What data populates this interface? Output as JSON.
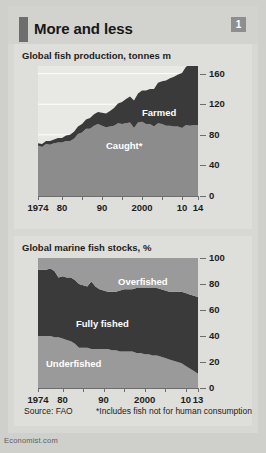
{
  "header": {
    "title": "More and less",
    "badge": "1"
  },
  "footer": {
    "source": "Source: FAO",
    "note": "*Includes fish not for human consumption",
    "brand": "Economist.com"
  },
  "colors": {
    "page_background": "#cfcfcb",
    "panel_background": "#dededa",
    "plot_background": "#e8e8e4",
    "light_gray": "#9a9a9a",
    "mid_gray": "#8c8c8c",
    "dark": "#3a3a3a",
    "text": "#1d1d20",
    "axis": "#6d6d6d"
  },
  "chart_data": [
    {
      "id": "fish-production",
      "type": "area",
      "stacked": true,
      "title": "Global fish production, tonnes m",
      "xlabel": "",
      "ylabel": "",
      "ylim": [
        0,
        170
      ],
      "yticks": [
        0,
        40,
        80,
        120,
        160
      ],
      "grid": true,
      "legend": "inline-labels",
      "xlim": [
        1974,
        2014
      ],
      "xticks": [
        1974,
        1980,
        1985,
        1990,
        1995,
        2000,
        2005,
        2010,
        2014
      ],
      "xticklabels": [
        "1974",
        "80",
        "",
        "90",
        "",
        "2000",
        "",
        "10",
        "14"
      ],
      "x": [
        1974,
        1975,
        1976,
        1977,
        1978,
        1979,
        1980,
        1981,
        1982,
        1983,
        1984,
        1985,
        1986,
        1987,
        1988,
        1989,
        1990,
        1991,
        1992,
        1993,
        1994,
        1995,
        1996,
        1997,
        1998,
        1999,
        2000,
        2001,
        2002,
        2003,
        2004,
        2005,
        2006,
        2007,
        2008,
        2009,
        2010,
        2011,
        2012,
        2013,
        2014
      ],
      "series": [
        {
          "name": "Caught*",
          "color": "#8c8c8c",
          "label_position": "lower-middle",
          "values": [
            66,
            64,
            68,
            67,
            69,
            70,
            70,
            72,
            72,
            75,
            81,
            83,
            88,
            88,
            92,
            94,
            92,
            90,
            91,
            92,
            95,
            94,
            95,
            96,
            89,
            96,
            97,
            94,
            94,
            91,
            95,
            94,
            92,
            92,
            91,
            91,
            89,
            93,
            92,
            93,
            93
          ]
        },
        {
          "name": "Farmed",
          "color": "#3a3a3a",
          "label_position": "upper-right",
          "values": [
            3,
            4,
            4,
            5,
            5,
            6,
            6,
            7,
            8,
            9,
            10,
            11,
            12,
            14,
            15,
            16,
            17,
            18,
            20,
            23,
            26,
            29,
            32,
            34,
            36,
            38,
            41,
            44,
            46,
            49,
            53,
            56,
            59,
            62,
            65,
            68,
            72,
            76,
            80,
            84,
            88
          ]
        }
      ],
      "total_note": "top of stack reaches about 167 in 2014"
    },
    {
      "id": "marine-fish-stocks",
      "type": "area",
      "stacked": true,
      "title": "Global marine fish stocks, %",
      "xlabel": "",
      "ylabel": "",
      "ylim": [
        0,
        100
      ],
      "yticks": [
        0,
        20,
        40,
        60,
        80,
        100
      ],
      "grid": true,
      "legend": "inline-labels",
      "xlim": [
        1974,
        2013
      ],
      "xticks": [
        1974,
        1980,
        1985,
        1990,
        1995,
        2000,
        2005,
        2010,
        2013
      ],
      "xticklabels": [
        "1974",
        "80",
        "",
        "90",
        "",
        "2000",
        "",
        "10",
        "13"
      ],
      "x": [
        1974,
        1975,
        1976,
        1977,
        1978,
        1979,
        1980,
        1981,
        1982,
        1983,
        1984,
        1985,
        1986,
        1987,
        1988,
        1989,
        1990,
        1991,
        1992,
        1993,
        1994,
        1995,
        1996,
        1997,
        1998,
        1999,
        2000,
        2001,
        2002,
        2003,
        2004,
        2005,
        2006,
        2007,
        2008,
        2009,
        2010,
        2011,
        2012,
        2013
      ],
      "series": [
        {
          "name": "Underfished",
          "color": "#9a9a9a",
          "label_position": "lower-left",
          "values": [
            40,
            40,
            40,
            40,
            39,
            39,
            38,
            37,
            36,
            34,
            31,
            31,
            31,
            30,
            30,
            30,
            30,
            30,
            29,
            29,
            28,
            28,
            28,
            28,
            27,
            27,
            26,
            26,
            25,
            25,
            24,
            23,
            22,
            21,
            20,
            19,
            17,
            15,
            13,
            11
          ]
        },
        {
          "name": "Fully fished",
          "color": "#3a3a3a",
          "label_position": "middle",
          "values": [
            51,
            51,
            51,
            52,
            51,
            46,
            48,
            48,
            49,
            49,
            49,
            48,
            47,
            52,
            48,
            46,
            45,
            44,
            45,
            45,
            47,
            48,
            48,
            48,
            50,
            50,
            51,
            51,
            52,
            52,
            52,
            52,
            52,
            53,
            54,
            55,
            56,
            57,
            58,
            59
          ]
        },
        {
          "name": "Overfished",
          "color": "#9a9a9a",
          "label_position": "upper-right",
          "values": [
            9,
            9,
            9,
            8,
            10,
            15,
            14,
            15,
            15,
            17,
            20,
            21,
            22,
            18,
            22,
            24,
            25,
            26,
            26,
            26,
            25,
            24,
            24,
            24,
            23,
            23,
            23,
            23,
            23,
            23,
            24,
            25,
            26,
            26,
            26,
            26,
            27,
            28,
            29,
            30
          ]
        }
      ]
    }
  ]
}
